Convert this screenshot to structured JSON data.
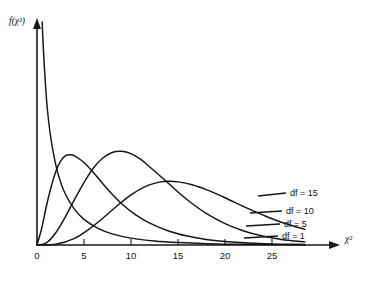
{
  "chart_data": {
    "type": "line",
    "title": "",
    "subtitle": "",
    "xlabel": "χ²",
    "ylabel": "f(χ²)",
    "xlim": [
      0,
      28.5
    ],
    "ylim": [
      0,
      1.0
    ],
    "grid": false,
    "legend_position": "inline-right",
    "xticks": [
      0,
      5,
      10,
      15,
      20,
      25
    ],
    "xtick_labels": [
      "0",
      "5",
      "10",
      "15",
      "20",
      "25"
    ],
    "yticks": [],
    "ytick_labels": [],
    "annotations": [
      "df = 15",
      "df = 10",
      "df = 5",
      "df = 1"
    ],
    "series": [
      {
        "name": "df = 1",
        "label": "df = 1",
        "df": 1,
        "peak_x": 0,
        "points": [
          [
            0.55,
            1.0
          ],
          [
            0.7,
            0.86
          ],
          [
            0.9,
            0.72
          ],
          [
            1.1,
            0.61
          ],
          [
            1.4,
            0.5
          ],
          [
            1.8,
            0.4
          ],
          [
            2.3,
            0.31
          ],
          [
            3.0,
            0.23
          ],
          [
            4.0,
            0.16
          ],
          [
            5.0,
            0.115
          ],
          [
            6.5,
            0.075
          ],
          [
            8.0,
            0.05
          ],
          [
            10.0,
            0.031
          ],
          [
            12.5,
            0.018
          ],
          [
            15.0,
            0.011
          ],
          [
            18.0,
            0.006
          ],
          [
            21.0,
            0.0035
          ],
          [
            24.0,
            0.002
          ],
          [
            27.0,
            0.0012
          ],
          [
            28.5,
            0.001
          ]
        ]
      },
      {
        "name": "df = 5",
        "label": "df = 5",
        "df": 5,
        "peak_x": 3,
        "points": [
          [
            0.0,
            0.0
          ],
          [
            0.5,
            0.075
          ],
          [
            1.0,
            0.175
          ],
          [
            1.5,
            0.26
          ],
          [
            2.0,
            0.33
          ],
          [
            2.5,
            0.375
          ],
          [
            3.0,
            0.4
          ],
          [
            3.5,
            0.405
          ],
          [
            4.0,
            0.4
          ],
          [
            5.0,
            0.37
          ],
          [
            6.0,
            0.325
          ],
          [
            7.0,
            0.275
          ],
          [
            8.0,
            0.228
          ],
          [
            9.0,
            0.185
          ],
          [
            10.5,
            0.135
          ],
          [
            12.0,
            0.098
          ],
          [
            14.0,
            0.063
          ],
          [
            16.0,
            0.04
          ],
          [
            18.0,
            0.025
          ],
          [
            20.0,
            0.016
          ],
          [
            22.5,
            0.009
          ],
          [
            25.0,
            0.005
          ],
          [
            27.0,
            0.0032
          ],
          [
            28.5,
            0.0023
          ]
        ]
      },
      {
        "name": "df = 10",
        "label": "df = 10",
        "df": 10,
        "peak_x": 8,
        "points": [
          [
            0.0,
            0.0
          ],
          [
            1.0,
            0.01
          ],
          [
            2.0,
            0.055
          ],
          [
            3.0,
            0.125
          ],
          [
            4.0,
            0.205
          ],
          [
            5.0,
            0.28
          ],
          [
            6.0,
            0.345
          ],
          [
            7.0,
            0.39
          ],
          [
            8.0,
            0.415
          ],
          [
            9.0,
            0.42
          ],
          [
            10.0,
            0.41
          ],
          [
            11.0,
            0.385
          ],
          [
            12.0,
            0.35
          ],
          [
            13.5,
            0.295
          ],
          [
            15.0,
            0.238
          ],
          [
            16.5,
            0.186
          ],
          [
            18.0,
            0.142
          ],
          [
            20.0,
            0.096
          ],
          [
            22.0,
            0.063
          ],
          [
            24.0,
            0.04
          ],
          [
            26.0,
            0.025
          ],
          [
            28.5,
            0.014
          ]
        ]
      },
      {
        "name": "df = 15",
        "label": "df = 15",
        "df": 15,
        "peak_x": 13,
        "points": [
          [
            0.0,
            0.0
          ],
          [
            2.0,
            0.003
          ],
          [
            4.0,
            0.03
          ],
          [
            5.5,
            0.07
          ],
          [
            7.0,
            0.12
          ],
          [
            8.5,
            0.175
          ],
          [
            10.0,
            0.225
          ],
          [
            11.5,
            0.262
          ],
          [
            13.0,
            0.282
          ],
          [
            14.0,
            0.286
          ],
          [
            15.0,
            0.283
          ],
          [
            16.5,
            0.27
          ],
          [
            18.0,
            0.248
          ],
          [
            20.0,
            0.212
          ],
          [
            22.0,
            0.172
          ],
          [
            24.0,
            0.135
          ],
          [
            26.0,
            0.102
          ],
          [
            28.5,
            0.07
          ]
        ]
      }
    ]
  },
  "axis": {
    "y_label_text": "f(χ²)",
    "x_label_text": "χ²"
  },
  "labels": {
    "df15": "df = 15",
    "df10": "df = 10",
    "df5": "df = 5",
    "df1": "df = 1"
  },
  "ticks": {
    "t0": "0",
    "t5": "5",
    "t10": "10",
    "t15": "15",
    "t20": "20",
    "t25": "25"
  },
  "colors": {
    "ink": "#141414",
    "background": "#ffffff"
  }
}
